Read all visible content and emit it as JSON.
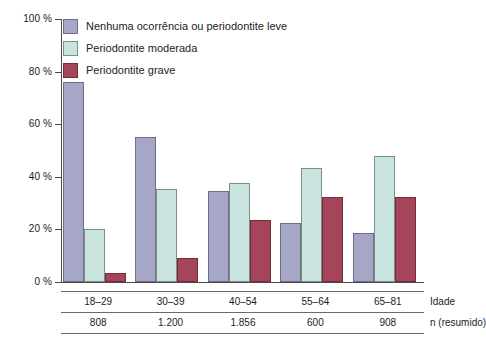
{
  "chart_data": {
    "type": "bar",
    "title": "",
    "subtitle": "",
    "xlabel": "Idade",
    "ylabel": "",
    "categories": [
      "18–29",
      "30–39",
      "40–54",
      "55–64",
      "65–81"
    ],
    "series": [
      {
        "name": "Nenhuma ocorrência ou periodontite leve",
        "color": "#a6a6c6",
        "values": [
          76,
          55,
          34.5,
          22.5,
          18.5
        ]
      },
      {
        "name": "Periodontite moderada",
        "color": "#c9e3de",
        "values": [
          20,
          35.5,
          37.5,
          43.5,
          48
        ]
      },
      {
        "name": "Periodontite grave",
        "color": "#a6455a",
        "values": [
          3.5,
          9,
          23.5,
          32.5,
          32.5
        ]
      }
    ],
    "ylim": [
      0,
      100
    ],
    "yticks": [
      0,
      20,
      40,
      60,
      80,
      100
    ],
    "ytick_labels": [
      "0 %",
      "20 %",
      "40 %",
      "60 %",
      "80 %",
      "100 %"
    ],
    "grid": false,
    "legend_position": "top-left",
    "units": "percent"
  },
  "legend": {
    "items": [
      {
        "label": "Nenhuma ocorrência ou periodontite leve",
        "swatch": "series-0-swatch"
      },
      {
        "label": "Periodontite moderada",
        "swatch": "series-1-swatch"
      },
      {
        "label": "Periodontite grave",
        "swatch": "series-2-swatch"
      }
    ]
  },
  "axis": {
    "y_labels": [
      "100 %",
      "80 %",
      "60 %",
      "40 %",
      "20 %",
      "0 %"
    ]
  },
  "table": {
    "rows": [
      {
        "row_label": "Idade",
        "cells": [
          "18–29",
          "30–39",
          "40–54",
          "55–64",
          "65–81"
        ]
      },
      {
        "row_label": "n (resumido)",
        "cells": [
          "808",
          "1.200",
          "1.856",
          "600",
          "908"
        ]
      }
    ]
  },
  "colors": {
    "series_0": "#a6a6c6",
    "series_1": "#c9e3de",
    "series_2": "#a6455a",
    "axis": "#4a4a4a",
    "text": "#1c1c1c",
    "background": "#ffffff"
  }
}
